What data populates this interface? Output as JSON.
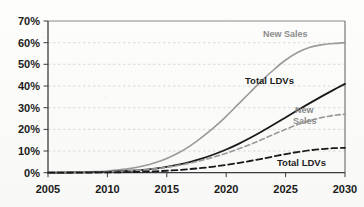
{
  "chart_data": {
    "type": "line",
    "title": "",
    "subtitle": "",
    "xlabel": "",
    "ylabel": "",
    "xlim": [
      2005,
      2030
    ],
    "ylim": [
      0,
      70
    ],
    "grid": true,
    "grid_style": "horizontal dashed light gray",
    "legend": "inline curve labels (no legend box)",
    "x_tick_labels": [
      "2005",
      "2010",
      "2015",
      "2020",
      "2025",
      "2030"
    ],
    "x_ticks": [
      2005,
      2010,
      2015,
      2020,
      2025,
      2030
    ],
    "y_tick_labels": [
      "0%",
      "10%",
      "20%",
      "30%",
      "40%",
      "50%",
      "60%",
      "70%"
    ],
    "y_ticks": [
      0,
      10,
      20,
      30,
      40,
      50,
      60,
      70
    ],
    "x": [
      2005,
      2006,
      2007,
      2008,
      2009,
      2010,
      2011,
      2012,
      2013,
      2014,
      2015,
      2016,
      2017,
      2018,
      2019,
      2020,
      2021,
      2022,
      2023,
      2024,
      2025,
      2026,
      2027,
      2028,
      2029,
      2030
    ],
    "series": [
      {
        "name": "New Sales",
        "label": "New Sales",
        "style": "solid",
        "color": "#9a9a9a",
        "width": 1.6,
        "values": [
          0.1,
          0.15,
          0.2,
          0.3,
          0.5,
          0.8,
          1.3,
          2.0,
          3.1,
          4.6,
          6.6,
          9.2,
          12.5,
          16.5,
          21.0,
          26.0,
          31.5,
          37.0,
          42.5,
          47.5,
          52.0,
          55.5,
          57.8,
          59.0,
          59.6,
          60.0
        ],
        "end_value": 60
      },
      {
        "name": "Total LDVs",
        "label": "Total LDVs",
        "style": "solid",
        "color": "#1a1a1a",
        "width": 1.8,
        "values": [
          0.05,
          0.07,
          0.1,
          0.15,
          0.25,
          0.4,
          0.6,
          0.9,
          1.3,
          1.9,
          2.7,
          3.7,
          5.0,
          6.6,
          8.5,
          10.7,
          13.2,
          16.0,
          19.0,
          22.2,
          25.5,
          28.8,
          32.0,
          35.1,
          38.1,
          41.0
        ],
        "end_value": 41
      },
      {
        "name": "New Sales",
        "label": "New\nSales",
        "style": "dashed",
        "color": "#9a9a9a",
        "width": 1.6,
        "values": [
          0.05,
          0.07,
          0.1,
          0.15,
          0.22,
          0.35,
          0.55,
          0.85,
          1.25,
          1.8,
          2.5,
          3.4,
          4.5,
          5.8,
          7.3,
          9.0,
          10.9,
          13.0,
          15.3,
          17.7,
          20.0,
          22.2,
          24.0,
          25.4,
          26.4,
          27.0
        ],
        "end_value": 27
      },
      {
        "name": "Total LDVs",
        "label": "Total LDVs",
        "style": "dashed",
        "color": "#1a1a1a",
        "width": 1.8,
        "values": [
          0.02,
          0.03,
          0.04,
          0.06,
          0.09,
          0.14,
          0.2,
          0.3,
          0.45,
          0.65,
          0.9,
          1.25,
          1.7,
          2.2,
          2.85,
          3.6,
          4.45,
          5.4,
          6.4,
          7.5,
          8.6,
          9.5,
          10.3,
          10.9,
          11.3,
          11.5
        ],
        "end_value": 11.5
      }
    ],
    "annotations": [
      {
        "name": "new-sales-solid-label",
        "text": "New Sales",
        "color": "#8b8b8b"
      },
      {
        "name": "total-ldvs-solid-label",
        "text": "Total LDVs",
        "color": "#1d1d1d"
      },
      {
        "name": "new-sales-dashed-label-line1",
        "text": "New",
        "color": "#8b8b8b"
      },
      {
        "name": "new-sales-dashed-label-line2",
        "text": "Sales",
        "color": "#8b8b8b"
      },
      {
        "name": "total-ldvs-dashed-label",
        "text": "Total LDVs",
        "color": "#1d1d1d"
      }
    ]
  },
  "axis": {
    "y_labels": [
      "70%",
      "60%",
      "50%",
      "40%",
      "30%",
      "20%",
      "10%",
      "0%"
    ],
    "x_labels": [
      "2005",
      "2010",
      "2015",
      "2020",
      "2025",
      "2030"
    ]
  },
  "labels": {
    "new_sales_solid": "New Sales",
    "total_ldvs_solid": "Total LDVs",
    "new_sales_dashed_1": "New",
    "new_sales_dashed_2": "Sales",
    "total_ldvs_dashed": "Total LDVs"
  },
  "colors": {
    "gray_series": "#9a9a9a",
    "dark_series": "#1a1a1a",
    "axis": "#4a4a4a",
    "grid": "#c9c9c9",
    "background": "#fbfbfa"
  }
}
